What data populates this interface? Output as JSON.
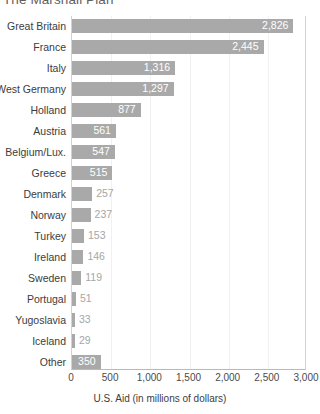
{
  "chart_data": {
    "type": "bar",
    "orientation": "horizontal",
    "title": "The Marshall Plan",
    "xlabel": "U.S. Aid (in millions of dollars)",
    "ylabel": "",
    "xlim": [
      0,
      3000
    ],
    "xticks": [
      "0",
      "500",
      "1,000",
      "1,500",
      "2,000",
      "2,500",
      "3,000"
    ],
    "xtick_values": [
      0,
      500,
      1000,
      1500,
      2000,
      2500,
      3000
    ],
    "grid": true,
    "legend": "none",
    "bar_color": "#a9a9a9",
    "inside_label_color": "#ffffff",
    "outside_label_color": "#a6a6a6",
    "categories": [
      "Great Britain",
      "France",
      "Italy",
      "West Germany",
      "Holland",
      "Austria",
      "Belgium/Lux.",
      "Greece",
      "Denmark",
      "Norway",
      "Turkey",
      "Ireland",
      "Sweden",
      "Portugal",
      "Yugoslavia",
      "Iceland",
      "Other"
    ],
    "values": [
      2826,
      2445,
      1316,
      1297,
      877,
      561,
      547,
      515,
      257,
      237,
      153,
      146,
      119,
      51,
      33,
      29,
      350
    ],
    "value_labels": [
      "2,826",
      "2,445",
      "1,316",
      "1,297",
      "877",
      "561",
      "547",
      "515",
      "257",
      "237",
      "153",
      "146",
      "119",
      "51",
      "33",
      "29",
      "350"
    ],
    "label_placement": [
      "inside",
      "inside",
      "inside",
      "inside",
      "inside",
      "inside",
      "inside",
      "inside",
      "outside",
      "outside",
      "outside",
      "outside",
      "outside",
      "outside",
      "outside",
      "outside",
      "inside"
    ],
    "bar_draw_widths": [
      2826,
      2445,
      1316,
      1297,
      877,
      561,
      547,
      515,
      257,
      237,
      153,
      146,
      119,
      51,
      33,
      29,
      350
    ]
  }
}
